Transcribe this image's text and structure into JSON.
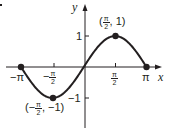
{
  "chart_data": {
    "type": "line",
    "title": "",
    "function": "y = sin(x)",
    "xlabel": "x",
    "ylabel": "y",
    "xlim": [
      -3.1416,
      3.1416
    ],
    "ylim": [
      -1.8,
      2.1
    ],
    "grid": false,
    "legend": null,
    "x_ticks": [
      {
        "value": -3.1416,
        "label": "−π"
      },
      {
        "value": -1.5708,
        "label": "−π/2"
      },
      {
        "value": 1.5708,
        "label": "π/2"
      },
      {
        "value": 3.1416,
        "label": "π"
      }
    ],
    "y_ticks": [
      {
        "value": 1,
        "label": "1"
      },
      {
        "value": -1,
        "label": "−1"
      }
    ],
    "series": [
      {
        "name": "sin x",
        "color": "#231f20",
        "x": [
          -3.1416,
          -2.3562,
          -1.5708,
          -0.7854,
          0,
          0.7854,
          1.5708,
          2.3562,
          3.1416
        ],
        "values": [
          0,
          -0.7071,
          -1,
          -0.7071,
          0,
          0.7071,
          1,
          0.7071,
          0
        ]
      }
    ],
    "highlighted_points": [
      {
        "x": -3.1416,
        "y": 0,
        "label": ""
      },
      {
        "x": -1.5708,
        "y": -1,
        "label": "(−π/2, −1)"
      },
      {
        "x": 1.5708,
        "y": 1,
        "label": "(π/2, 1)"
      },
      {
        "x": 3.1416,
        "y": 0,
        "label": ""
      }
    ],
    "annotations": [
      "(π/2, 1)",
      "(−π/2, −1)"
    ]
  },
  "labels": {
    "x_axis": "x",
    "y_axis": "y",
    "tick_neg_pi": "−π",
    "tick_pi": "π",
    "tick_y_pos": "1",
    "tick_y_neg": "−1",
    "minus": "−",
    "pi": "π",
    "two": "2",
    "max_point_open": "(",
    "max_point_close": ", 1)",
    "min_point_open": "(−",
    "min_point_close": ", −1)"
  },
  "colors": {
    "ink": "#231f20",
    "background": "#ffffff"
  }
}
